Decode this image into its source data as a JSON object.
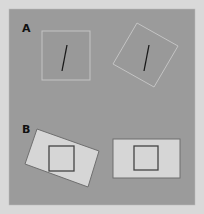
{
  "figure": {
    "background": "#d9d9d9",
    "panel_color": "#9a9a9a",
    "panels": [
      {
        "label": "A",
        "description": "Rod-and-frame illusion: upright square frame and tilted square frame, each containing a tilted line"
      },
      {
        "label": "B",
        "description": "Tilted rectangle and upright rectangle, each containing an upright inner square"
      }
    ]
  }
}
